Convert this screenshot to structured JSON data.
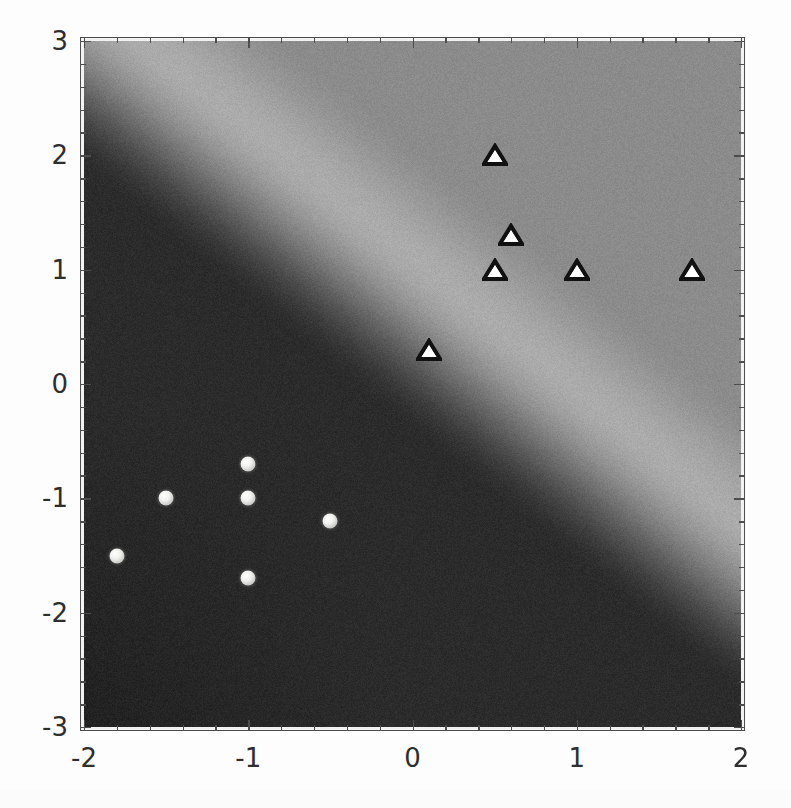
{
  "chart_data": {
    "type": "scatter",
    "title": "",
    "subtitle": "",
    "xlabel": "",
    "ylabel": "",
    "xlim": [
      -2,
      2
    ],
    "ylim": [
      -3,
      3
    ],
    "grid": false,
    "legend": "none",
    "background": "decision-function density map (grayscale)",
    "x_ticks": [
      -2,
      -1,
      0,
      1,
      2
    ],
    "x_tick_labels": [
      "-2",
      "-1",
      "0",
      "1",
      "2"
    ],
    "y_ticks": [
      -3,
      -2,
      -1,
      0,
      1,
      2,
      3
    ],
    "y_tick_labels": [
      "-3",
      "-2",
      "-1",
      "0",
      "1",
      "2",
      "3"
    ],
    "x_minor_ticks_per_interval": 4,
    "y_minor_ticks_per_interval": 4,
    "series": [
      {
        "name": "class-circle",
        "marker": "circle",
        "marker_fill": "#f2f2ee",
        "marker_edge": "#9a9a95",
        "points": [
          {
            "x": -1.8,
            "y": -1.5
          },
          {
            "x": -1.5,
            "y": -1.0
          },
          {
            "x": -1.0,
            "y": -0.7
          },
          {
            "x": -1.0,
            "y": -1.0
          },
          {
            "x": -1.0,
            "y": -1.7
          },
          {
            "x": -0.5,
            "y": -1.2
          }
        ]
      },
      {
        "name": "class-triangle",
        "marker": "triangle",
        "marker_fill": "#ffffff",
        "marker_edge": "#111111",
        "points": [
          {
            "x": 0.1,
            "y": 0.3
          },
          {
            "x": 0.5,
            "y": 1.0
          },
          {
            "x": 0.5,
            "y": 2.0
          },
          {
            "x": 0.6,
            "y": 1.3
          },
          {
            "x": 1.0,
            "y": 1.0
          },
          {
            "x": 1.7,
            "y": 1.0
          }
        ]
      }
    ],
    "density": {
      "description": "smooth diagonal grayscale gradient: dark lower-left, bright diagonal ridge from upper-left to lower-right, medium gray upper-right",
      "dark_value": "#2b2b2b",
      "ridge_value": "#ababab",
      "upper_value": "#8b8b8b",
      "ridge_line": {
        "slope": -1.15,
        "intercept": 1.1
      },
      "noise": "fine film grain"
    }
  },
  "colors": {
    "axis": "#4d4d4d",
    "tick_label": "#2e2e2e",
    "page_background": "#fdfdfd",
    "frame_background": "#f2f2f2"
  }
}
